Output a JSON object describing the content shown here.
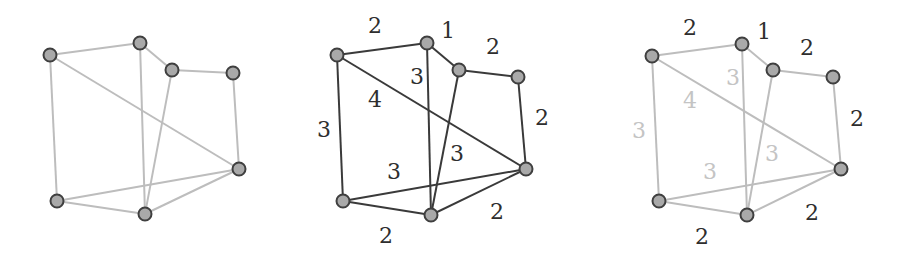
{
  "figure": {
    "colors": {
      "node_fill": "#a9a9a9",
      "node_stroke": "#3f3f3f",
      "edge_light": "#bdbdbd",
      "edge_dark": "#3a3a3a",
      "label_dark": "#2e2e2e",
      "label_light": "#c4c4c4"
    }
  },
  "panels": [
    {
      "name": "graph-plain",
      "edge_style": "light",
      "nodes": {
        "A": [
          50,
          55
        ],
        "B": [
          140,
          43
        ],
        "C": [
          172,
          70
        ],
        "D": [
          233,
          73
        ],
        "E": [
          239,
          169
        ],
        "F": [
          57,
          201
        ],
        "G": [
          145,
          214
        ]
      },
      "edges": [
        [
          "A",
          "B"
        ],
        [
          "B",
          "C"
        ],
        [
          "C",
          "D"
        ],
        [
          "D",
          "E"
        ],
        [
          "A",
          "E"
        ],
        [
          "A",
          "F"
        ],
        [
          "B",
          "G"
        ],
        [
          "C",
          "G"
        ],
        [
          "F",
          "E"
        ],
        [
          "F",
          "G"
        ],
        [
          "G",
          "E"
        ]
      ],
      "labels": []
    },
    {
      "name": "graph-weighted",
      "edge_style": "dark",
      "nodes": {
        "A": [
          337,
          55
        ],
        "B": [
          427,
          43
        ],
        "C": [
          459,
          70
        ],
        "D": [
          518,
          77
        ],
        "E": [
          526,
          169
        ],
        "F": [
          343,
          201
        ],
        "G": [
          431,
          215
        ]
      },
      "edges": [
        [
          "A",
          "B"
        ],
        [
          "B",
          "C"
        ],
        [
          "C",
          "D"
        ],
        [
          "D",
          "E"
        ],
        [
          "A",
          "E"
        ],
        [
          "A",
          "F"
        ],
        [
          "B",
          "G"
        ],
        [
          "C",
          "G"
        ],
        [
          "F",
          "E"
        ],
        [
          "F",
          "G"
        ],
        [
          "G",
          "E"
        ]
      ],
      "labels": [
        {
          "text": "2",
          "x": 375,
          "y": 25,
          "tone": "dark"
        },
        {
          "text": "1",
          "x": 448,
          "y": 30,
          "tone": "dark"
        },
        {
          "text": "2",
          "x": 493,
          "y": 46,
          "tone": "dark"
        },
        {
          "text": "3",
          "x": 417,
          "y": 76,
          "tone": "dark"
        },
        {
          "text": "4",
          "x": 375,
          "y": 99,
          "tone": "dark"
        },
        {
          "text": "3",
          "x": 324,
          "y": 129,
          "tone": "dark"
        },
        {
          "text": "2",
          "x": 542,
          "y": 117,
          "tone": "dark"
        },
        {
          "text": "3",
          "x": 457,
          "y": 153,
          "tone": "dark"
        },
        {
          "text": "3",
          "x": 394,
          "y": 171,
          "tone": "dark"
        },
        {
          "text": "2",
          "x": 497,
          "y": 211,
          "tone": "dark"
        },
        {
          "text": "2",
          "x": 386,
          "y": 235,
          "tone": "dark"
        }
      ]
    },
    {
      "name": "graph-highlight-light-edges",
      "edge_style": "light",
      "nodes": {
        "A": [
          652,
          56
        ],
        "B": [
          742,
          44
        ],
        "C": [
          773,
          70
        ],
        "D": [
          833,
          77
        ],
        "E": [
          841,
          169
        ],
        "F": [
          659,
          201
        ],
        "G": [
          747,
          215
        ]
      },
      "edges": [
        [
          "A",
          "B"
        ],
        [
          "B",
          "C"
        ],
        [
          "C",
          "D"
        ],
        [
          "D",
          "E"
        ],
        [
          "A",
          "E"
        ],
        [
          "A",
          "F"
        ],
        [
          "B",
          "G"
        ],
        [
          "C",
          "G"
        ],
        [
          "F",
          "E"
        ],
        [
          "F",
          "G"
        ],
        [
          "G",
          "E"
        ]
      ],
      "labels": [
        {
          "text": "2",
          "x": 690,
          "y": 27,
          "tone": "dark"
        },
        {
          "text": "1",
          "x": 764,
          "y": 31,
          "tone": "dark"
        },
        {
          "text": "2",
          "x": 807,
          "y": 47,
          "tone": "dark"
        },
        {
          "text": "3",
          "x": 733,
          "y": 77,
          "tone": "light"
        },
        {
          "text": "4",
          "x": 690,
          "y": 100,
          "tone": "light"
        },
        {
          "text": "3",
          "x": 639,
          "y": 130,
          "tone": "light"
        },
        {
          "text": "2",
          "x": 857,
          "y": 118,
          "tone": "dark"
        },
        {
          "text": "3",
          "x": 772,
          "y": 153,
          "tone": "light"
        },
        {
          "text": "3",
          "x": 710,
          "y": 171,
          "tone": "light"
        },
        {
          "text": "2",
          "x": 812,
          "y": 212,
          "tone": "dark"
        },
        {
          "text": "2",
          "x": 702,
          "y": 236,
          "tone": "dark"
        }
      ]
    }
  ]
}
